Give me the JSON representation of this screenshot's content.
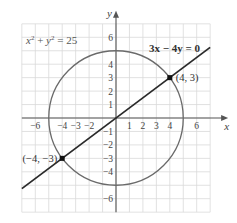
{
  "chart_data": {
    "type": "line",
    "title": "",
    "xlabel": "x",
    "ylabel": "y",
    "xlim": [
      -7,
      7
    ],
    "ylim": [
      -7,
      7
    ],
    "grid": true,
    "x_tick_labels": [
      "-6",
      "-4",
      "-3",
      "-2",
      "1",
      "2",
      "3",
      "4",
      "6"
    ],
    "x_tick_values": [
      -6,
      -4,
      -3,
      -2,
      1,
      2,
      3,
      4,
      6
    ],
    "y_tick_labels": [
      "6",
      "4",
      "3",
      "2",
      "1",
      "-1",
      "-2",
      "-3",
      "-4",
      "-6"
    ],
    "y_tick_values": [
      6,
      4,
      3,
      2,
      1,
      -1,
      -2,
      -3,
      -4,
      -6
    ],
    "series": [
      {
        "name": "x² + y² = 25",
        "kind": "circle",
        "center": [
          0,
          0
        ],
        "radius": 5,
        "color": "#6a6a6a"
      },
      {
        "name": "3x − 4y = 0",
        "kind": "line",
        "slope": 0.75,
        "x_range": [
          -7,
          7
        ],
        "color": "#2a2a2a"
      }
    ],
    "points": [
      {
        "x": 4,
        "y": 3,
        "label": "(4, 3)"
      },
      {
        "x": -4,
        "y": -3,
        "label": "(−4, −3)"
      }
    ],
    "annotations": [
      {
        "text_base": "x",
        "text_full": "x² + y² = 25",
        "position": "upper-left"
      },
      {
        "text_full": "3x − 4y = 0",
        "position": "upper-right",
        "bold": true
      }
    ]
  },
  "labels": {
    "x_axis": "x",
    "y_axis": "y",
    "circle_eq_x": "x",
    "circle_eq_y": "y",
    "circle_eq_exp": "2",
    "circle_eq_plus": " + ",
    "circle_eq_rest": " = 25",
    "line_eq": "3x − 4y = 0",
    "point_a": "(4, 3)",
    "point_b": "(−4, −3)"
  }
}
